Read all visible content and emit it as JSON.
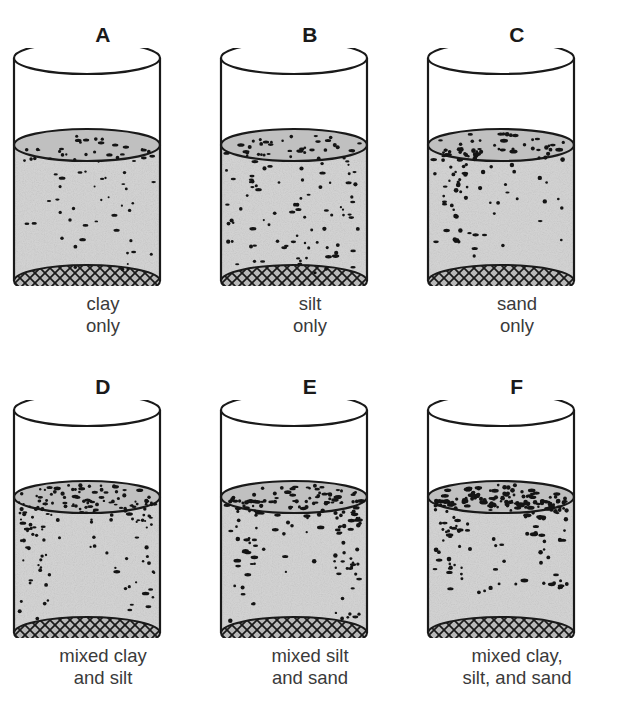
{
  "figure": {
    "title_visible": false,
    "columns": 3,
    "rows": 2,
    "colors": {
      "outline": "#1a1a1a",
      "water_fill": "#d2d2d2",
      "water_surface": "#c0c0c0",
      "mesh_fill": "#b8b8b8",
      "particle": "#141414",
      "label_text": "#1a1a1a",
      "caption_text": "#3a3a3a",
      "background": "#ffffff"
    },
    "panels": [
      {
        "letter": "A",
        "caption_lines": [
          "clay",
          "only"
        ],
        "caption_full": "clay only",
        "contents": "clay only",
        "particle_density": "sparse",
        "particle_pattern": "scattered-upper",
        "particle_count": 72,
        "particle_size": 1.8,
        "seed": 11
      },
      {
        "letter": "B",
        "caption_lines": [
          "silt",
          "only"
        ],
        "caption_full": "silt only",
        "contents": "silt only",
        "particle_density": "medium",
        "particle_pattern": "scattered-throughout",
        "particle_count": 120,
        "particle_size": 2.0,
        "seed": 23
      },
      {
        "letter": "C",
        "caption_lines": [
          "sand",
          "only"
        ],
        "caption_full": "sand only",
        "contents": "sand only",
        "particle_density": "medium",
        "particle_pattern": "clustered-upper-left",
        "particle_count": 115,
        "particle_size": 2.2,
        "seed": 37
      },
      {
        "letter": "D",
        "caption_lines": [
          "mixed clay",
          "and silt"
        ],
        "caption_full": "mixed clay and silt",
        "contents": "mixed clay and silt",
        "particle_density": "dense",
        "particle_pattern": "edges-and-surface",
        "particle_count": 165,
        "particle_size": 2.0,
        "seed": 53
      },
      {
        "letter": "E",
        "caption_lines": [
          "mixed silt",
          "and sand"
        ],
        "caption_full": "mixed silt and sand",
        "contents": "mixed silt and sand",
        "particle_density": "dense",
        "particle_pattern": "edges-and-surface",
        "particle_count": 175,
        "particle_size": 2.1,
        "seed": 71
      },
      {
        "letter": "F",
        "caption_lines": [
          "mixed clay,",
          "silt, and sand"
        ],
        "caption_full": "mixed clay, silt, and sand",
        "contents": "mixed clay, silt, and sand",
        "particle_density": "very-dense",
        "particle_pattern": "concentrated-surface",
        "particle_count": 210,
        "particle_size": 2.2,
        "seed": 97
      }
    ],
    "beaker_geometry": {
      "cylinder_left": 14,
      "cylinder_right": 160,
      "rim_top_y": 10,
      "rim_ellipse_ry": 16,
      "water_line_y": 97,
      "bottom_y": 233,
      "description": "open cylinder drawn in perspective: elliptical rim at top, gray water fill from water line to cross-hatched elliptical mesh bottom"
    }
  }
}
